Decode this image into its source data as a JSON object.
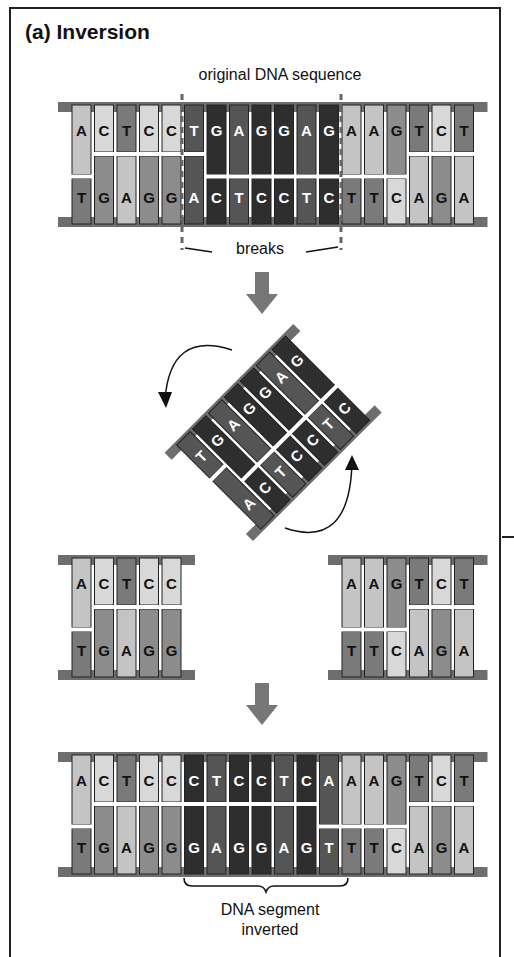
{
  "figure": {
    "title": "(a) Inversion",
    "labels": {
      "original": "original DNA sequence",
      "breaks": "breaks",
      "inverted_line1": "DNA segment",
      "inverted_line2": "inverted"
    },
    "colors": {
      "backbone": "#6e6e6e",
      "A": "#c4c4c4",
      "C": "#d8d8d8",
      "T": "#7a7a7a",
      "G": "#8c8c8c",
      "segment_dark": "#2e2e2e",
      "segment_mid": "#555555",
      "arrow": "#777777",
      "frame": "#222222"
    },
    "original": {
      "top": [
        "A",
        "C",
        "T",
        "C",
        "C",
        "T",
        "G",
        "A",
        "G",
        "G",
        "A",
        "G",
        "A",
        "A",
        "G",
        "T",
        "C",
        "T"
      ],
      "bottom": [
        "T",
        "G",
        "A",
        "G",
        "G",
        "A",
        "C",
        "T",
        "C",
        "C",
        "T",
        "C",
        "T",
        "T",
        "C",
        "A",
        "G",
        "A"
      ],
      "segment_range": [
        5,
        11
      ]
    },
    "rotated_segment": {
      "top": [
        "T",
        "G",
        "A",
        "G",
        "G",
        "A",
        "G"
      ],
      "bottom": [
        "A",
        "C",
        "T",
        "C",
        "C",
        "T",
        "C"
      ]
    },
    "left_piece": {
      "top": [
        "A",
        "C",
        "T",
        "C",
        "C"
      ],
      "bottom": [
        "T",
        "G",
        "A",
        "G",
        "G"
      ]
    },
    "right_piece": {
      "top": [
        "A",
        "A",
        "G",
        "T",
        "C",
        "T"
      ],
      "bottom": [
        "T",
        "T",
        "C",
        "A",
        "G",
        "A"
      ]
    },
    "result": {
      "top": [
        "A",
        "C",
        "T",
        "C",
        "C",
        "C",
        "T",
        "C",
        "C",
        "T",
        "C",
        "A",
        "A",
        "A",
        "G",
        "T",
        "C",
        "T"
      ],
      "bottom": [
        "T",
        "G",
        "A",
        "G",
        "G",
        "G",
        "A",
        "G",
        "G",
        "A",
        "G",
        "T",
        "T",
        "T",
        "C",
        "A",
        "G",
        "A"
      ],
      "segment_range": [
        5,
        11
      ]
    }
  }
}
